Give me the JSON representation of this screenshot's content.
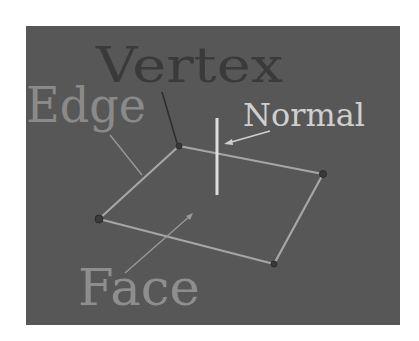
{
  "diagram": {
    "colors": {
      "background": "#575757",
      "page": "#ffffff",
      "edge_line": "#a6a6a6",
      "normal_line": "#dedede",
      "vertex_label": "#3a3a3a",
      "edge_label": "#8a8a8a",
      "normal_label": "#cfcfcf",
      "face_label": "#8e8e8e",
      "leader_dark": "#2e2e2e",
      "leader_light": "#9a9a9a"
    },
    "labels": {
      "vertex": "Vertex",
      "edge": "Edge",
      "normal": "Normal",
      "face": "Face"
    },
    "vertices": [
      {
        "name": "top",
        "x": 179,
        "y": 146
      },
      {
        "name": "right",
        "x": 323,
        "y": 174
      },
      {
        "name": "bottom",
        "x": 274,
        "y": 264
      },
      {
        "name": "left",
        "x": 99,
        "y": 219
      }
    ],
    "normal": {
      "x": 217,
      "y1": 118,
      "y2": 195
    }
  }
}
